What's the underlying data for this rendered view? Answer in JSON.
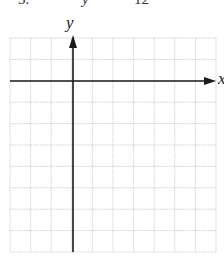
{
  "header": {
    "fragment_left": "3.",
    "fragment_mid": "y",
    "fragment_right": "12"
  },
  "graph": {
    "y_axis_label": "y",
    "x_axis_label": "x",
    "grid": {
      "columns": 10,
      "rows": 10
    },
    "origin": {
      "column": 3,
      "row": 2
    },
    "colors": {
      "grid": "#c8c8c8",
      "axis": "#1a1a1a",
      "background": "#ffffff"
    }
  }
}
